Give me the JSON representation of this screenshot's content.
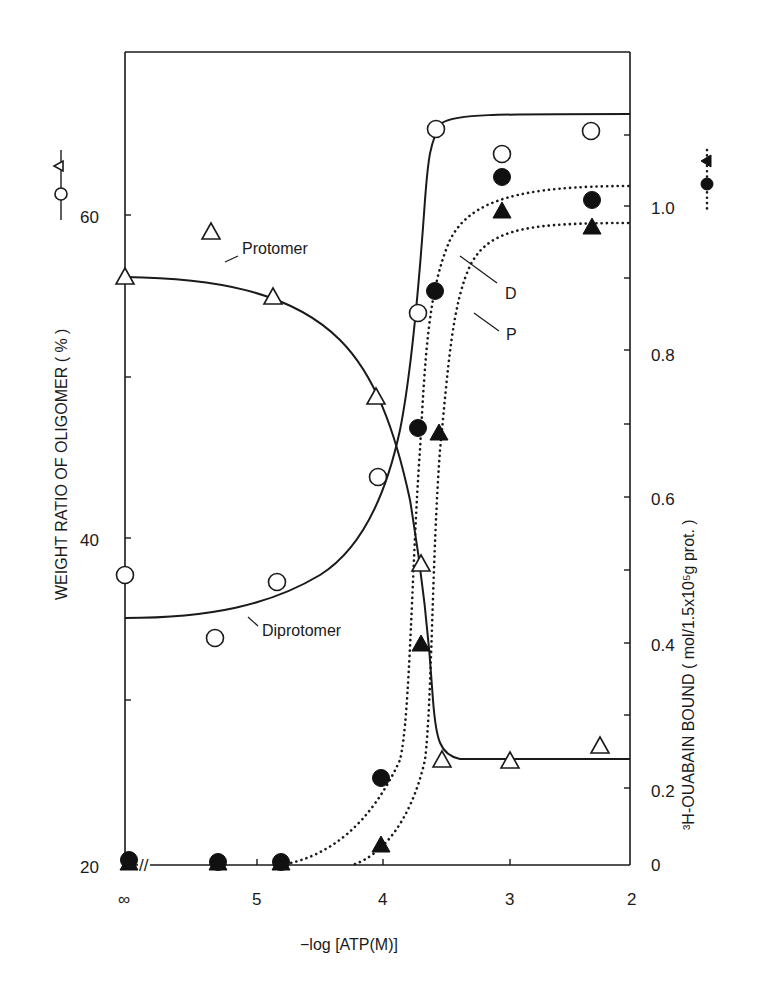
{
  "chart_data": {
    "type": "scatter",
    "title": "",
    "xlabel": "-log [ATP(M)]",
    "ylabel_left": "WEIGHT RATIO OF OLIGOMER(%)",
    "ylabel_left_legend": "○,△ —",
    "ylabel_right": "³H-OUABAIN BOUND (mol/1.5x10⁵g prot.)",
    "ylabel_right_legend": "···●,▲···",
    "x_ticks": [
      "∞",
      "5",
      "4",
      "3",
      "2"
    ],
    "x_axis_break": "//",
    "xlim": [
      5.9,
      2
    ],
    "ylim_left": [
      20,
      68
    ],
    "ylim_right": [
      0,
      1.15
    ],
    "y_ticks_left": [
      "20",
      "40",
      "60"
    ],
    "y_ticks_right": [
      "0",
      "0.2",
      "0.4",
      "0.6",
      "0.8",
      "1.0"
    ],
    "grid": false,
    "series": [
      {
        "name": "Diprotomer",
        "axis": "left",
        "marker": "open-circle",
        "line": "solid",
        "x": [
          "∞",
          5.3,
          4.8,
          4.0,
          3.7,
          3.6,
          3.05,
          2.35
        ],
        "y": [
          37.7,
          33.8,
          37.3,
          43.8,
          53.9,
          63.8,
          63.7,
          65.2
        ]
      },
      {
        "name": "Protomer",
        "axis": "left",
        "marker": "open-triangle",
        "line": "solid",
        "x": [
          "∞",
          5.3,
          4.8,
          4.05,
          3.7,
          3.55,
          3.0,
          2.3
        ],
        "y": [
          56.1,
          58.9,
          54.9,
          48.7,
          38.3,
          26.2,
          26.2,
          27.1
        ]
      },
      {
        "name": "D (ouabain bound, diprotomer)",
        "axis": "right",
        "marker": "filled-circle",
        "line": "dotted",
        "x": [
          "∞",
          5.3,
          4.8,
          4.0,
          3.75,
          3.65,
          3.05,
          2.35
        ],
        "y": [
          0,
          0,
          0,
          0.07,
          0.66,
          0.84,
          1.06,
          1.01
        ]
      },
      {
        "name": "P (ouabain bound, protomer)",
        "axis": "right",
        "marker": "filled-triangle",
        "line": "dotted",
        "x": [
          "∞",
          5.3,
          4.8,
          4.0,
          3.7,
          3.55,
          3.05,
          2.35
        ],
        "y": [
          0,
          0,
          0,
          0.03,
          0.33,
          0.65,
          1.0,
          0.97
        ]
      }
    ],
    "annotations": [
      "Protomer",
      "Diprotomer",
      "D",
      "P"
    ]
  },
  "labels": {
    "x_axis_title": "−log [ATP(M)]",
    "left_axis_title": "WEIGHT  RATIO  OF  OLIGOMER ( % )",
    "left_axis_legend": "○,△",
    "right_axis_title": "³H-OUABAIN  BOUND ( mol/1.5x10⁵g  prot. )",
    "right_axis_legend": "●,▲",
    "annot_protomer": "Protomer",
    "annot_diprotomer": "Diprotomer",
    "annot_d": "D",
    "annot_p": "P",
    "x_tick_inf": "∞",
    "x_tick_5": "5",
    "x_tick_4": "4",
    "x_tick_3": "3",
    "x_tick_2": "2",
    "y_left_20": "20",
    "y_left_40": "40",
    "y_left_60": "60",
    "y_right_0": "0",
    "y_right_02": "0.2",
    "y_right_04": "0.4",
    "y_right_06": "0.6",
    "y_right_08": "0.8",
    "y_right_10": "1.0",
    "axis_break": "//"
  },
  "points": {
    "open_circles": [
      [
        125,
        575
      ],
      [
        215,
        638
      ],
      [
        277,
        582
      ],
      [
        378,
        477
      ],
      [
        418,
        313
      ],
      [
        436,
        129
      ],
      [
        502,
        154
      ],
      [
        591,
        131
      ]
    ],
    "open_triangles": [
      [
        125,
        278
      ],
      [
        211,
        233
      ],
      [
        273,
        298
      ],
      [
        376,
        398
      ],
      [
        421,
        565
      ],
      [
        442,
        761
      ],
      [
        510,
        762
      ],
      [
        600,
        747
      ]
    ],
    "filled_circles": [
      [
        129,
        860
      ],
      [
        218,
        862
      ],
      [
        281,
        862
      ],
      [
        381,
        778
      ],
      [
        418,
        428
      ],
      [
        435,
        291
      ],
      [
        502,
        177
      ],
      [
        592,
        200
      ]
    ],
    "filled_triangles": [
      [
        129,
        864
      ],
      [
        218,
        864
      ],
      [
        281,
        864
      ],
      [
        381,
        846
      ],
      [
        421,
        645
      ],
      [
        439,
        434
      ],
      [
        502,
        212
      ],
      [
        592,
        228
      ]
    ]
  }
}
